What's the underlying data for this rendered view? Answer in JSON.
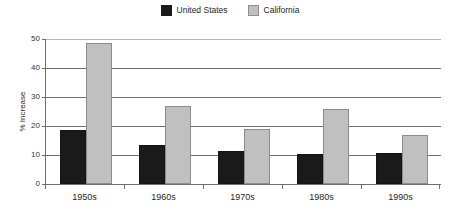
{
  "chart_data": {
    "type": "bar",
    "title": "",
    "subtitle": "",
    "xlabel": "",
    "ylabel": "% Increase",
    "categories": [
      "1950s",
      "1960s",
      "1970s",
      "1980s",
      "1990s"
    ],
    "series": [
      {
        "name": "United States",
        "color": "#1a1a1a",
        "values": [
          18.5,
          13.5,
          11.5,
          10.3,
          10.8
        ]
      },
      {
        "name": "California",
        "color": "#c0c0c0",
        "values": [
          48.5,
          27.0,
          19.0,
          26.0,
          17.0
        ]
      }
    ],
    "ylim": [
      0,
      50
    ],
    "yticks": [
      0,
      10,
      20,
      30,
      40,
      50
    ],
    "ytick_labels": [
      "0",
      "10",
      "20",
      "30",
      "40",
      "50"
    ],
    "grid": true,
    "grid_axis": "y",
    "legend_position": "top-center",
    "bar_layout": "grouped-adjacent"
  },
  "legend": {
    "entries": [
      {
        "label": "United States",
        "swatch": "legend-swatch-united-states"
      },
      {
        "label": "California",
        "swatch": "legend-swatch-california"
      }
    ]
  },
  "axes": {
    "y_title": "% Increase",
    "y_labels": [
      "50",
      "40",
      "30",
      "20",
      "10",
      "0"
    ],
    "x_labels": [
      "1950s",
      "1960s",
      "1970s",
      "1980s",
      "1990s"
    ]
  },
  "colors": {
    "united_states": "#1a1a1a",
    "california": "#c0c0c0",
    "axis": "#6e6e6e",
    "grid": "#6e6e6e",
    "background": "#ffffff",
    "text": "#262626"
  }
}
